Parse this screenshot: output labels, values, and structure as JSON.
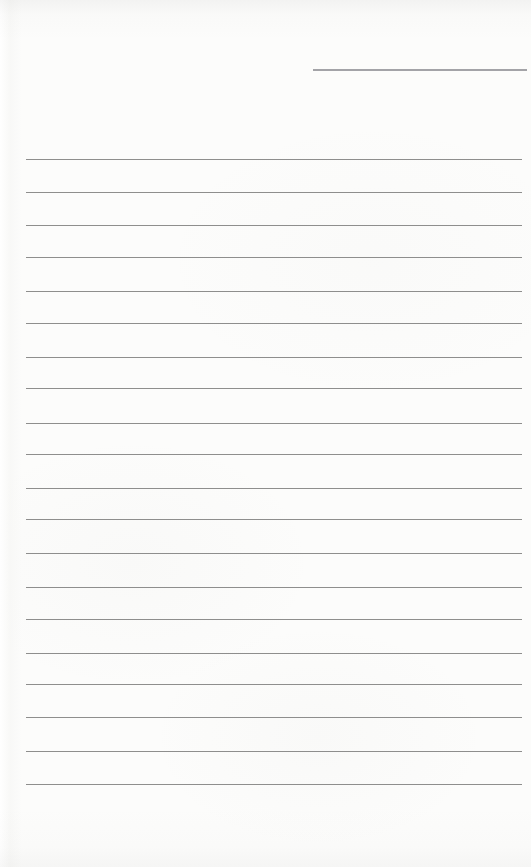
{
  "page": {
    "kind": "blank-lined-notebook-page",
    "paper_color": "#fcfcfb",
    "width": 531,
    "height": 867,
    "text_content": ""
  },
  "header_line": {
    "x": 313,
    "y": 69,
    "width": 214,
    "thickness": 2,
    "color": "#a3a3a7"
  },
  "ruled_lines": {
    "left": 26,
    "right": 522,
    "thickness": 1,
    "color": "#8e8e8d",
    "count": 20,
    "y_positions": [
      159,
      192,
      225,
      257,
      291,
      323,
      357,
      388,
      423,
      454,
      488,
      519,
      553,
      587,
      619,
      653,
      684,
      717,
      751,
      784
    ]
  }
}
